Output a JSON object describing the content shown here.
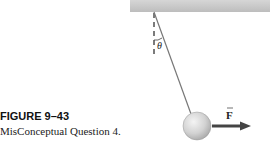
{
  "figure": {
    "label": "FIGURE 9–43",
    "caption": "MisConceptual Question 4.",
    "angle_symbol": "θ",
    "force_symbol": "F",
    "force_vector_mark": "→"
  },
  "colors": {
    "ceiling": "#c8c8c8",
    "string": "#777777",
    "arrow": "#444444",
    "ball": "#d0d0d0"
  }
}
